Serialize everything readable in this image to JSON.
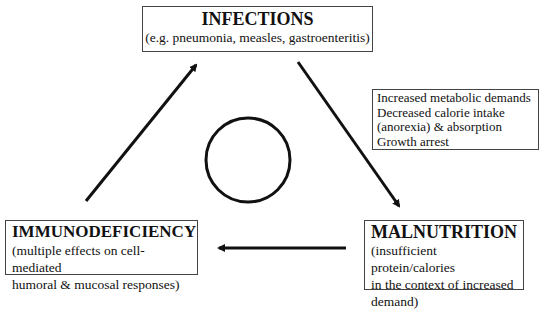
{
  "nodes": {
    "infections": {
      "title": "INFECTIONS",
      "subtitle": "(e.g. pneumonia, measles, gastroenteritis)"
    },
    "malnutrition": {
      "title": "MALNUTRITION",
      "lines": [
        "(insufficient protein/calories",
        "in the context of increased",
        "demand)"
      ]
    },
    "immunodeficiency": {
      "title": "IMMUNODEFICIENCY",
      "lines": [
        "(multiple effects on cell-mediated",
        "humoral & mucosal responses)"
      ]
    }
  },
  "edge_label": {
    "lines": [
      "Increased metabolic demands",
      "Decreased calorie intake",
      "(anorexia) & absorption",
      "Growth arrest"
    ]
  },
  "edges": [
    {
      "from": "infections",
      "to": "malnutrition"
    },
    {
      "from": "malnutrition",
      "to": "immunodeficiency"
    },
    {
      "from": "immunodeficiency",
      "to": "infections"
    }
  ],
  "center_symbol": "circle",
  "colors": {
    "line": "#111111",
    "border": "#444444",
    "background": "#ffffff"
  }
}
